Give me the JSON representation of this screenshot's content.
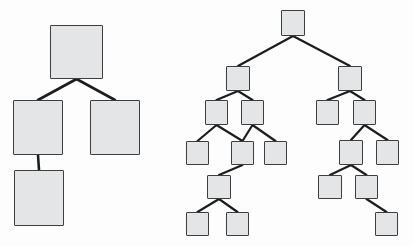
{
  "canvas": {
    "width": 413,
    "height": 246,
    "background": "#fdfdfd",
    "title": "Two node-link tree diagrams"
  },
  "style": {
    "node_fill": "#e3e5e6",
    "node_stroke": "#3c3e3f",
    "edge_stroke": "#1c1e1e",
    "edge_width_large": 2.6,
    "edge_width_small": 2.2
  },
  "diagrams": [
    {
      "id": "left-tree",
      "name": "left-tree",
      "label": "",
      "node_count": 4,
      "edge_count": 3,
      "node_size": 53,
      "nodes": [
        {
          "id": "L0",
          "name": "left-tree-node-root",
          "label": "",
          "x": 50,
          "y": 25,
          "w": 53,
          "h": 54
        },
        {
          "id": "L1",
          "name": "left-tree-node-child-1",
          "label": "",
          "x": 13,
          "y": 100,
          "w": 50,
          "h": 55
        },
        {
          "id": "L2",
          "name": "left-tree-node-child-2",
          "label": "",
          "x": 90,
          "y": 100,
          "w": 50,
          "h": 55
        },
        {
          "id": "L3",
          "name": "left-tree-node-grandchild",
          "label": "",
          "x": 14,
          "y": 170,
          "w": 50,
          "h": 56
        }
      ],
      "edges": [
        {
          "from": "L0",
          "to": "L1",
          "name": "left-tree-edge-root-child1"
        },
        {
          "from": "L0",
          "to": "L2",
          "name": "left-tree-edge-root-child2"
        },
        {
          "from": "L1",
          "to": "L3",
          "name": "left-tree-edge-child1-grandchild"
        }
      ]
    },
    {
      "id": "right-tree",
      "name": "right-tree",
      "label": "",
      "node_count": 16,
      "edge_count": 15,
      "node_size": 24,
      "nodes": [
        {
          "id": "R0",
          "name": "right-tree-node-root",
          "label": "",
          "x": 281,
          "y": 10,
          "w": 24,
          "h": 26
        },
        {
          "id": "RA",
          "name": "right-tree-node-left-branch",
          "label": "",
          "x": 226,
          "y": 66,
          "w": 24,
          "h": 25
        },
        {
          "id": "RA1",
          "name": "right-tree-node-la-1",
          "label": "",
          "x": 205,
          "y": 100,
          "w": 23,
          "h": 25
        },
        {
          "id": "RA2",
          "name": "right-tree-node-la-2",
          "label": "",
          "x": 241,
          "y": 100,
          "w": 23,
          "h": 25
        },
        {
          "id": "RA3",
          "name": "right-tree-node-la-3",
          "label": "",
          "x": 186,
          "y": 141,
          "w": 23,
          "h": 24
        },
        {
          "id": "RA4",
          "name": "right-tree-node-la-4",
          "label": "",
          "x": 231,
          "y": 141,
          "w": 23,
          "h": 24
        },
        {
          "id": "RA5",
          "name": "right-tree-node-la-5",
          "label": "",
          "x": 264,
          "y": 141,
          "w": 23,
          "h": 24
        },
        {
          "id": "RA6",
          "name": "right-tree-node-la-6",
          "label": "",
          "x": 207,
          "y": 175,
          "w": 24,
          "h": 24
        },
        {
          "id": "RA7",
          "name": "right-tree-node-la-7",
          "label": "",
          "x": 186,
          "y": 212,
          "w": 23,
          "h": 24
        },
        {
          "id": "RA8",
          "name": "right-tree-node-la-8",
          "label": "",
          "x": 226,
          "y": 212,
          "w": 23,
          "h": 24
        },
        {
          "id": "RB",
          "name": "right-tree-node-right-branch",
          "label": "",
          "x": 338,
          "y": 66,
          "w": 24,
          "h": 25
        },
        {
          "id": "RB1",
          "name": "right-tree-node-rb-1",
          "label": "",
          "x": 316,
          "y": 100,
          "w": 23,
          "h": 25
        },
        {
          "id": "RB2",
          "name": "right-tree-node-rb-2",
          "label": "",
          "x": 353,
          "y": 100,
          "w": 23,
          "h": 25
        },
        {
          "id": "RB3",
          "name": "right-tree-node-rb-3",
          "label": "",
          "x": 339,
          "y": 140,
          "w": 24,
          "h": 25
        },
        {
          "id": "RB4",
          "name": "right-tree-node-rb-4",
          "label": "",
          "x": 376,
          "y": 140,
          "w": 23,
          "h": 25
        },
        {
          "id": "RB5",
          "name": "right-tree-node-rb-5",
          "label": "",
          "x": 318,
          "y": 175,
          "w": 24,
          "h": 24
        },
        {
          "id": "RB6",
          "name": "right-tree-node-rb-6",
          "label": "",
          "x": 355,
          "y": 175,
          "w": 23,
          "h": 24
        },
        {
          "id": "RB7",
          "name": "right-tree-node-rb-7",
          "label": "",
          "x": 375,
          "y": 212,
          "w": 23,
          "h": 24
        }
      ],
      "edges": [
        {
          "from": "R0",
          "to": "RA",
          "name": "right-tree-edge-root-left"
        },
        {
          "from": "R0",
          "to": "RB",
          "name": "right-tree-edge-root-right"
        },
        {
          "from": "RA",
          "to": "RA1",
          "name": "right-tree-edge-la-1"
        },
        {
          "from": "RA",
          "to": "RA2",
          "name": "right-tree-edge-la-2"
        },
        {
          "from": "RA1",
          "to": "RA3",
          "name": "right-tree-edge-la-3"
        },
        {
          "from": "RA1",
          "to": "RA4",
          "name": "right-tree-edge-la-4"
        },
        {
          "from": "RA2",
          "to": "RA4",
          "name": "right-tree-edge-la-5"
        },
        {
          "from": "RA2",
          "to": "RA5",
          "name": "right-tree-edge-la-6"
        },
        {
          "from": "RA4",
          "to": "RA6",
          "name": "right-tree-edge-la-7"
        },
        {
          "from": "RA6",
          "to": "RA7",
          "name": "right-tree-edge-la-8"
        },
        {
          "from": "RA6",
          "to": "RA8",
          "name": "right-tree-edge-la-9"
        },
        {
          "from": "RB",
          "to": "RB1",
          "name": "right-tree-edge-rb-1"
        },
        {
          "from": "RB",
          "to": "RB2",
          "name": "right-tree-edge-rb-2"
        },
        {
          "from": "RB2",
          "to": "RB3",
          "name": "right-tree-edge-rb-3"
        },
        {
          "from": "RB2",
          "to": "RB4",
          "name": "right-tree-edge-rb-4"
        },
        {
          "from": "RB3",
          "to": "RB5",
          "name": "right-tree-edge-rb-5"
        },
        {
          "from": "RB3",
          "to": "RB6",
          "name": "right-tree-edge-rb-6"
        },
        {
          "from": "RB6",
          "to": "RB7",
          "name": "right-tree-edge-rb-7"
        }
      ]
    }
  ]
}
